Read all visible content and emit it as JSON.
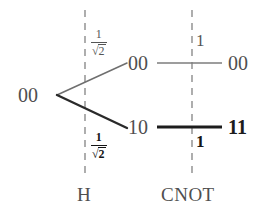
{
  "figure": {
    "type": "quantum-circuit-amplitude-tree",
    "gates": [
      {
        "label": "H",
        "x": 85
      },
      {
        "label": "CNOT",
        "x": 192
      }
    ],
    "input_state": {
      "label": "00",
      "bold": false
    },
    "branches": [
      {
        "id": "upper",
        "amplitude": {
          "numerator": "1",
          "denominator_radicand": "2",
          "radical": "√",
          "text": "1/√2"
        },
        "mid_state": {
          "label": "00",
          "bold": false
        },
        "cnot_amplitude": {
          "label": "1",
          "bold": false
        },
        "out_state": {
          "label": "00",
          "bold": false
        },
        "bold": false
      },
      {
        "id": "lower",
        "amplitude": {
          "numerator": "1",
          "denominator_radicand": "2",
          "radical": "√",
          "text": "1/√2"
        },
        "mid_state": {
          "label": "10",
          "bold": true
        },
        "cnot_amplitude": {
          "label": "1",
          "bold": true
        },
        "out_state": {
          "label": "11",
          "bold": true
        },
        "bold": true
      }
    ],
    "colors": {
      "light_stroke": "#7a7a7a",
      "dark_stroke": "#1c1c1c",
      "dashed_stroke": "#9a9a9a",
      "text": "#4f4f4f",
      "text_bold": "#161616",
      "background": "#ffffff"
    }
  }
}
